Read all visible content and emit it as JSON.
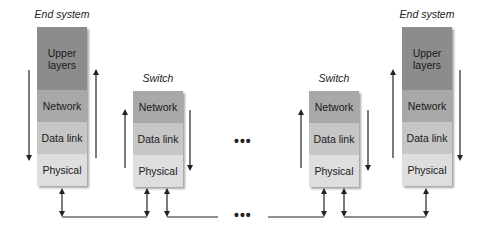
{
  "diagram": {
    "end_system_label": "End system",
    "switch_label": "Switch",
    "ellipsis": "•••",
    "layers": {
      "upper": "Upper layers",
      "network": "Network",
      "datalink": "Data link",
      "physical": "Physical"
    },
    "nodes": [
      {
        "type": "end-system",
        "label": "End system",
        "layers": [
          "Upper layers",
          "Network",
          "Data link",
          "Physical"
        ]
      },
      {
        "type": "switch",
        "label": "Switch",
        "layers": [
          "Network",
          "Data link",
          "Physical"
        ]
      },
      {
        "type": "switch",
        "label": "Switch",
        "layers": [
          "Network",
          "Data link",
          "Physical"
        ]
      },
      {
        "type": "end-system",
        "label": "End system",
        "layers": [
          "Upper layers",
          "Network",
          "Data link",
          "Physical"
        ]
      }
    ],
    "colors": {
      "upper": "#8c8c8c",
      "network": "#a8a8a8",
      "datalink": "#c6c6c6",
      "physical": "#dedede",
      "line": "#222222"
    }
  }
}
